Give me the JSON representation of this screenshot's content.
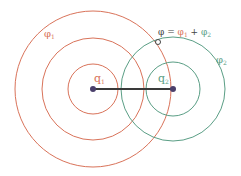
{
  "colors": {
    "phi1": "#d9735a",
    "phi2": "#5a9e85",
    "charge": "#4a3f6b",
    "line": "#3a3a3a",
    "text_dark": "#444444"
  },
  "labels": {
    "phi1": {
      "sym": "φ",
      "sub": "1"
    },
    "phi2": {
      "sym": "φ",
      "sub": "2"
    },
    "q1": {
      "sym": "q",
      "sub": "1"
    },
    "q2": {
      "sym": "q",
      "sub": "2"
    },
    "sum": {
      "phi": "φ",
      "eq": " = ",
      "phi1": "φ",
      "sub1": "1",
      "plus": " + ",
      "phi2": "φ",
      "sub2": "2"
    }
  }
}
